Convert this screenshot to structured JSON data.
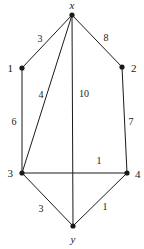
{
  "figure": {
    "background_color": "#ffffff",
    "stroke_color": "#1a1a1a",
    "label_color": "#1a1a1a"
  },
  "chart_data": {
    "type": "diagram",
    "title": "",
    "xlabel": "",
    "ylabel": "",
    "nodes": [
      {
        "id": "x",
        "label": "x",
        "italic": true,
        "x": 72,
        "y": 15,
        "label_x": 72,
        "label_y": 5,
        "label_anchor": "middle"
      },
      {
        "id": "n1",
        "label": "1",
        "italic": false,
        "x": 22,
        "y": 68,
        "label_x": 13,
        "label_y": 68,
        "label_anchor": "end"
      },
      {
        "id": "n2",
        "label": "2",
        "italic": false,
        "x": 122,
        "y": 67,
        "label_x": 131,
        "label_y": 68,
        "label_anchor": "start"
      },
      {
        "id": "n3",
        "label": "3",
        "italic": false,
        "x": 22,
        "y": 173,
        "label_x": 13,
        "label_y": 173,
        "label_anchor": "end"
      },
      {
        "id": "n4",
        "label": "4",
        "italic": false,
        "x": 127,
        "y": 173,
        "label_x": 135,
        "label_y": 174,
        "label_anchor": "start"
      },
      {
        "id": "y",
        "label": "y",
        "italic": true,
        "x": 73,
        "y": 226,
        "label_x": 73,
        "label_y": 239,
        "label_anchor": "middle"
      }
    ],
    "edges": [
      {
        "from": "x",
        "to": "n1",
        "weight": "3",
        "label_x": 40,
        "label_y": 39
      },
      {
        "from": "x",
        "to": "n2",
        "weight": "8",
        "label_x": 106,
        "label_y": 38
      },
      {
        "from": "x",
        "to": "n3",
        "weight": "4",
        "label_x": 41,
        "label_y": 95
      },
      {
        "from": "x",
        "to": "y",
        "weight": "10",
        "label_x": 84,
        "label_y": 94
      },
      {
        "from": "n1",
        "to": "n3",
        "weight": "6",
        "label_x": 14,
        "label_y": 122
      },
      {
        "from": "n2",
        "to": "n4",
        "weight": "7",
        "label_x": 131,
        "label_y": 122
      },
      {
        "from": "n3",
        "to": "n4",
        "weight": "1",
        "label_x": 99,
        "label_y": 161
      },
      {
        "from": "n3",
        "to": "y",
        "weight": "3",
        "label_x": 41,
        "label_y": 209
      },
      {
        "from": "n4",
        "to": "y",
        "weight": "1",
        "label_x": 105,
        "label_y": 207
      }
    ]
  }
}
